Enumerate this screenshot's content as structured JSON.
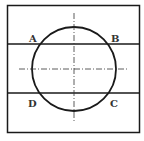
{
  "diagram": {
    "points": [
      {
        "label": "A",
        "x": 33,
        "y": 39
      },
      {
        "label": "B",
        "x": 115,
        "y": 39
      },
      {
        "label": "D",
        "x": 32,
        "y": 106
      },
      {
        "label": "C",
        "x": 114,
        "y": 106
      }
    ],
    "colors": {
      "stroke": "#1a1a1a",
      "background": "#ffffff"
    }
  }
}
